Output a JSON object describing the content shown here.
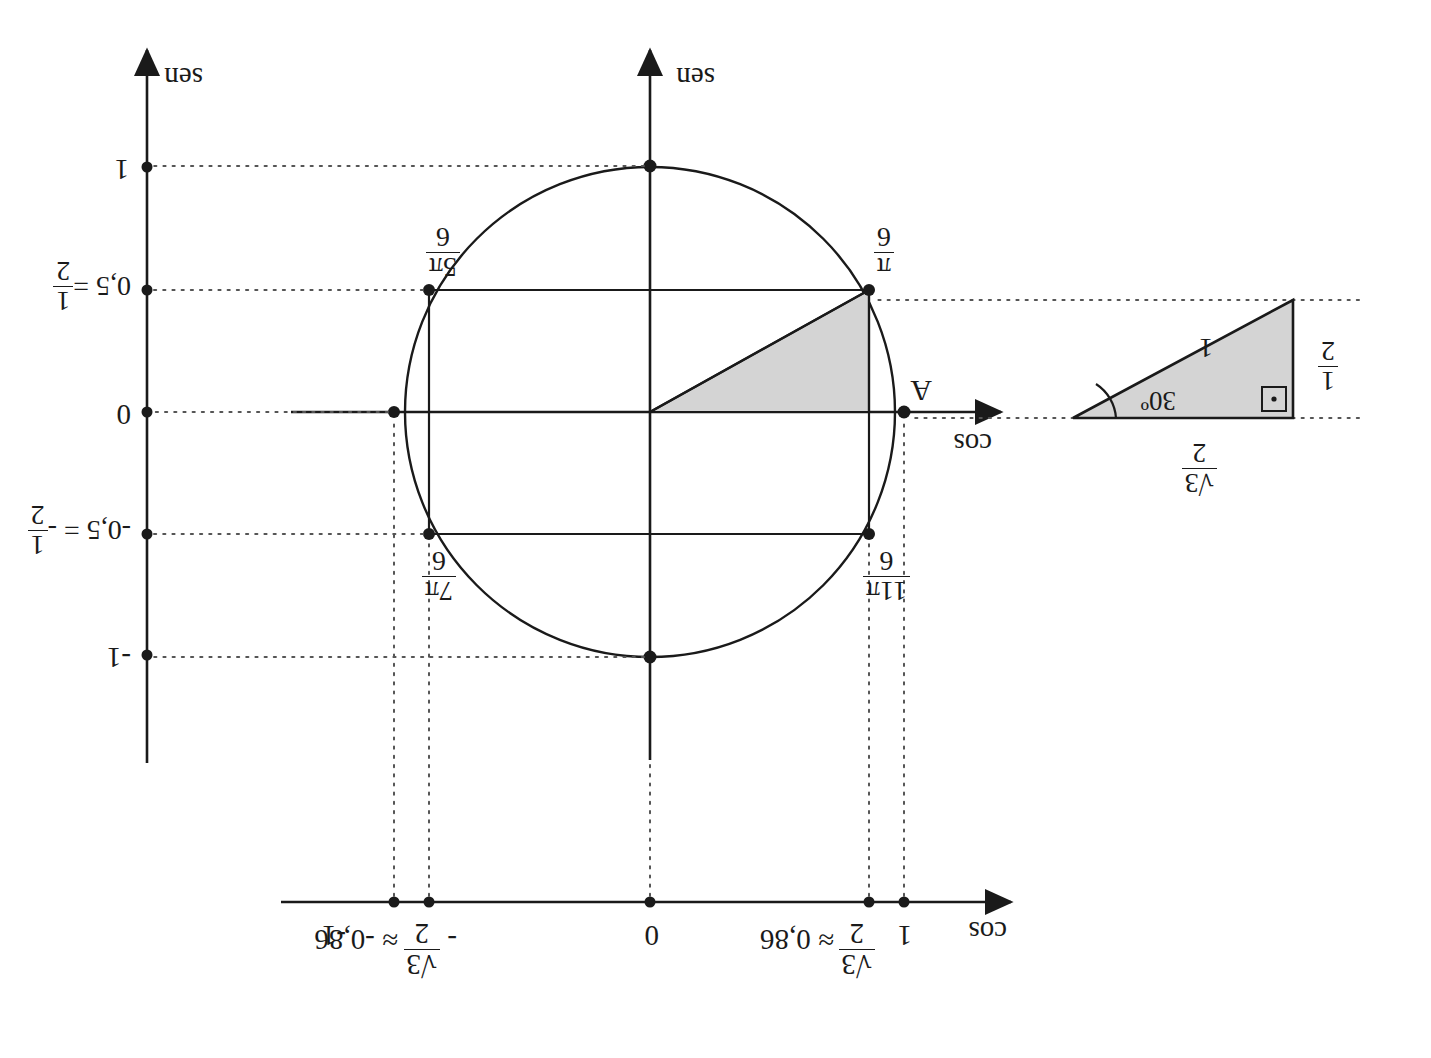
{
  "figure": {
    "kind": "unit-circle-trigonometry-diagram",
    "orientation_note": "printed upside down (rotated 180 degrees)",
    "ink_color": "#1a1a1a",
    "shade_color": "#d4d4d4"
  },
  "axes": {
    "cos_top": {
      "label": "cos",
      "arrow": "left"
    },
    "sen_center": {
      "label": "sen",
      "arrow": "down"
    },
    "sen_right": {
      "label": "sen",
      "arrow": "down"
    }
  },
  "cos_scale": {
    "name": "cos",
    "ticks": [
      {
        "id": "one",
        "value": 1,
        "text": "1"
      },
      {
        "id": "sqrt3over2",
        "value": 0.86,
        "approx": "≈ 0,86",
        "num": "√3",
        "den": "2",
        "sign": ""
      },
      {
        "id": "zero",
        "value": 0,
        "text": "0"
      },
      {
        "id": "neg-sqrt3over2",
        "value": -0.86,
        "approx": "≈ -0,86",
        "num": "√3",
        "den": "2",
        "sign": "-"
      },
      {
        "id": "neg-one",
        "value": -1,
        "text": "-1"
      }
    ]
  },
  "sen_scale": {
    "name": "sen",
    "ticks": [
      {
        "id": "one",
        "value": 1,
        "text": "1"
      },
      {
        "id": "half",
        "value": 0.5,
        "text": "0,5 =",
        "num": "1",
        "den": "2"
      },
      {
        "id": "zero",
        "value": 0,
        "text": "0"
      },
      {
        "id": "neg-half",
        "value": -0.5,
        "text": "-0,5 = -",
        "num": "1",
        "den": "2"
      },
      {
        "id": "neg-one",
        "value": -1,
        "text": "-1"
      }
    ]
  },
  "circle": {
    "radius_label": "1",
    "point_A": "A",
    "angle_points": [
      {
        "id": "pi-over-6",
        "num": "π",
        "den": "6",
        "cos": 0.866,
        "sen": 0.5
      },
      {
        "id": "5pi-over-6",
        "num": "5π",
        "den": "6",
        "cos": -0.866,
        "sen": 0.5
      },
      {
        "id": "7pi-over-6",
        "num": "7π",
        "den": "6",
        "cos": -0.866,
        "sen": -0.5
      },
      {
        "id": "11pi-over-6",
        "num": "11π",
        "den": "6",
        "cos": 0.866,
        "sen": -0.5
      }
    ]
  },
  "reference_triangle": {
    "angle": "30º",
    "hypotenuse": "1",
    "opposite_num": "1",
    "opposite_den": "2",
    "adjacent_num": "√3",
    "adjacent_den": "2",
    "right_angle_marker": "▪"
  }
}
